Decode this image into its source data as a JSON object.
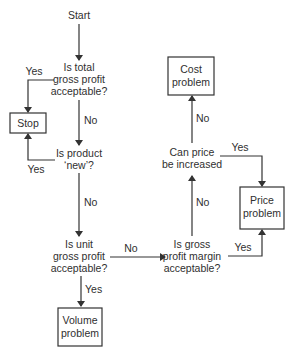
{
  "diagram": {
    "start": "Start",
    "q_total": [
      "Is total",
      "gross profit",
      "acceptable?"
    ],
    "q_new": [
      "Is product",
      "‘new’?"
    ],
    "q_unit": [
      "Is unit",
      "gross profit",
      "acceptable?"
    ],
    "q_margin": [
      "Is gross",
      "profit margin",
      "acceptable?"
    ],
    "q_price": [
      "Can price",
      "be increased"
    ],
    "box_stop": "Stop",
    "box_volume": [
      "Volume",
      "problem"
    ],
    "box_cost": [
      "Cost",
      "problem"
    ],
    "box_price": [
      "Price",
      "problem"
    ],
    "labels": {
      "total_yes": "Yes",
      "total_no": "No",
      "new_yes": "Yes",
      "new_no": "No",
      "unit_no": "No",
      "unit_yes": "Yes",
      "margin_no": "No",
      "margin_yes": "Yes",
      "price_no": "No",
      "price_yes": "Yes"
    }
  }
}
